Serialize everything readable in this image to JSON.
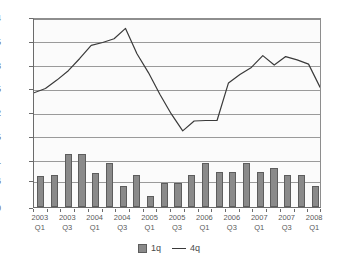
{
  "chart_data": {
    "type": "bar",
    "title": "",
    "subtitle": "",
    "xlabel": "",
    "ylabel": "",
    "ylim": [
      0,
      4
    ],
    "grid": true,
    "legend_position": "bottom",
    "ytick_labels": [
      "0",
      "0.56",
      "1",
      "1.5",
      "2",
      "2.5",
      "3",
      "3.5",
      "4"
    ],
    "ytick_values": [
      0,
      0.56,
      1,
      1.5,
      2,
      2.5,
      3,
      3.5,
      4
    ],
    "categories": [
      "2003 Q1",
      "2003 Q2",
      "2003 Q3",
      "2003 Q4",
      "2004 Q1",
      "2004 Q2",
      "2004 Q3",
      "2004 Q4",
      "2005 Q1",
      "2005 Q2",
      "2005 Q3",
      "2005 Q4",
      "2006 Q1",
      "2006 Q2",
      "2006 Q3",
      "2006 Q4",
      "2007 Q1",
      "2007 Q2",
      "2007 Q3",
      "2007 Q4",
      "2008 Q1"
    ],
    "xtick_labels": [
      {
        "year": "2003",
        "quarter": "Q1",
        "index": 0
      },
      {
        "year": "2003",
        "quarter": "Q3",
        "index": 2
      },
      {
        "year": "2004",
        "quarter": "Q1",
        "index": 4
      },
      {
        "year": "2004",
        "quarter": "Q3",
        "index": 6
      },
      {
        "year": "2005",
        "quarter": "Q1",
        "index": 8
      },
      {
        "year": "2005",
        "quarter": "Q3",
        "index": 10
      },
      {
        "year": "2006",
        "quarter": "Q1",
        "index": 12
      },
      {
        "year": "2006",
        "quarter": "Q3",
        "index": 14
      },
      {
        "year": "2007",
        "quarter": "Q1",
        "index": 16
      },
      {
        "year": "2007",
        "quarter": "Q3",
        "index": 18
      },
      {
        "year": "2008",
        "quarter": "Q1",
        "index": 20
      }
    ],
    "series": [
      {
        "name": "1q",
        "type": "bar",
        "color": "#8a8a8a",
        "border_color": "#5d5d5d",
        "values": [
          0.66,
          0.67,
          1.11,
          1.12,
          0.72,
          0.92,
          0.44,
          0.67,
          0.23,
          0.51,
          0.51,
          0.67,
          0.93,
          0.73,
          0.73,
          0.92,
          0.73,
          0.83,
          0.67,
          0.67,
          0.45
        ]
      },
      {
        "name": "4q",
        "type": "line",
        "color": "#3a3a3a",
        "values": [
          2.43,
          2.52,
          2.7,
          2.9,
          3.16,
          3.44,
          3.5,
          3.58,
          3.8,
          3.26,
          2.86,
          2.4,
          1.98,
          1.62,
          1.83,
          1.84,
          1.84,
          2.64,
          2.82,
          2.97,
          3.22
        ],
        "values_tail": [
          3.02,
          3.2,
          3.13,
          3.04,
          2.55
        ]
      }
    ]
  },
  "legend": {
    "entries": [
      {
        "label": "1q",
        "marker": "square-swatch"
      },
      {
        "label": "4q",
        "marker": "line-swatch"
      }
    ]
  }
}
